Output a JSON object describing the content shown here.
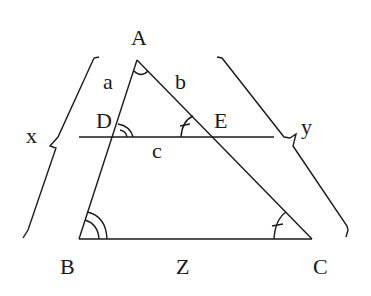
{
  "diagram": {
    "type": "geometry-similar-triangles",
    "points": {
      "A": {
        "label": "A",
        "x": 137,
        "y": 60
      },
      "B": {
        "label": "B",
        "x": 79,
        "y": 239
      },
      "C": {
        "label": "C",
        "x": 312,
        "y": 239
      },
      "D": {
        "label": "D",
        "x": 114,
        "y": 137
      },
      "E": {
        "label": "E",
        "x": 213,
        "y": 137
      }
    },
    "segment_labels": {
      "a": "a",
      "b": "b",
      "c": "c",
      "Z": "Z"
    },
    "brace_labels": {
      "x": "x",
      "y": "y"
    },
    "angle_marks": [
      {
        "at": "A",
        "type": "single-arc"
      },
      {
        "at": "D",
        "type": "double-arc"
      },
      {
        "at": "B",
        "type": "double-arc"
      },
      {
        "at": "E",
        "type": "arc-with-tick"
      },
      {
        "at": "C",
        "type": "arc-with-tick"
      }
    ],
    "line_color": "#1a1a1a"
  }
}
